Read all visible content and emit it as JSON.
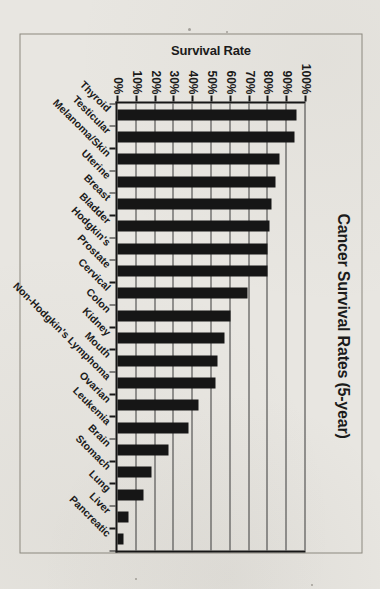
{
  "page": {
    "background": "#e8e6e1",
    "border_color": "#8b887f",
    "scan_specks": [
      {
        "x": 188,
        "y": 28,
        "size": 3
      },
      {
        "x": 226,
        "y": 31,
        "size": 2
      },
      {
        "x": 135,
        "y": 578,
        "size": 2
      },
      {
        "x": 311,
        "y": 584,
        "size": 2
      }
    ]
  },
  "chart_data": {
    "type": "bar",
    "layout": "column-chart-rotated-90deg-clockwise-on-portrait-page",
    "title": "Cancer Survival Rates (5-year)",
    "value_axis_label": "Survival Rate",
    "xlabel": "",
    "ylabel": "Survival Rate",
    "ylim": [
      0,
      100
    ],
    "grid": true,
    "legend": "none",
    "bar_color": "#161616",
    "grid_color": "#3a3a3a",
    "ink_color": "#1b1b1b",
    "value_ticks": [
      "0%",
      "10%",
      "20%",
      "30%",
      "40%",
      "50%",
      "60%",
      "70%",
      "80%",
      "90%",
      "100%"
    ],
    "categories": [
      "Thyroid",
      "Testicular",
      "Melanoma/Skin",
      "Uterine",
      "Breast",
      "Bladder",
      "Hodgkin's",
      "Prostate",
      "Cervical",
      "Colon",
      "Kidney",
      "Mouth",
      "Non-Hodgkin's Lymphoma",
      "Ovarian",
      "Leukemia",
      "Brain",
      "Stomach",
      "Lung",
      "Liver",
      "Pancreatic"
    ],
    "values": [
      95,
      94,
      86,
      84,
      82,
      81,
      80,
      80,
      69,
      60,
      57,
      53,
      52,
      43,
      38,
      27,
      18,
      14,
      6,
      3
    ]
  }
}
